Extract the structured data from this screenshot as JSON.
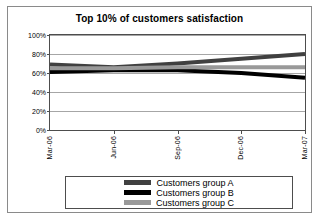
{
  "chart_data": {
    "type": "line",
    "title": "Top 10% of customers satisfaction",
    "xlabel": "",
    "ylabel": "",
    "categories": [
      "Mar-06",
      "Jun-06",
      "Sep-06",
      "Dec-06",
      "Mar-07"
    ],
    "x": [
      "Mar-06",
      "Jun-06",
      "Sep-06",
      "Dec-06",
      "Mar-07"
    ],
    "series": [
      {
        "name": "Customers group A",
        "color": "#404040",
        "values": [
          69,
          66,
          70,
          75,
          80
        ]
      },
      {
        "name": "Customers group B",
        "color": "#000000",
        "values": [
          61,
          63,
          63,
          60,
          55
        ]
      },
      {
        "name": "Customers group C",
        "color": "#999999",
        "values": [
          65,
          65,
          66,
          66,
          66
        ]
      }
    ],
    "ylim": [
      0,
      100
    ],
    "yticks": [
      0,
      20,
      40,
      60,
      80,
      100
    ],
    "ytick_labels": [
      "0%",
      "20%",
      "40%",
      "60%",
      "80%",
      "100%"
    ],
    "grid": true,
    "legend_position": "bottom"
  },
  "legend": {
    "items": [
      {
        "label": "Customers group A"
      },
      {
        "label": "Customers group B"
      },
      {
        "label": "Customers group C"
      }
    ]
  },
  "axis": {
    "y_labels": [
      "100%",
      "80%",
      "60%",
      "40%",
      "20%",
      "0%"
    ],
    "x_labels": [
      "Mar-06",
      "Jun-06",
      "Sep-06",
      "Dec-06",
      "Mar-07"
    ]
  },
  "colors": {
    "group_a": "#404040",
    "group_b": "#000000",
    "group_c": "#999999",
    "grid": "#a6a6a6",
    "axis": "#4d4d4d",
    "frame": "#8a8a8a"
  }
}
